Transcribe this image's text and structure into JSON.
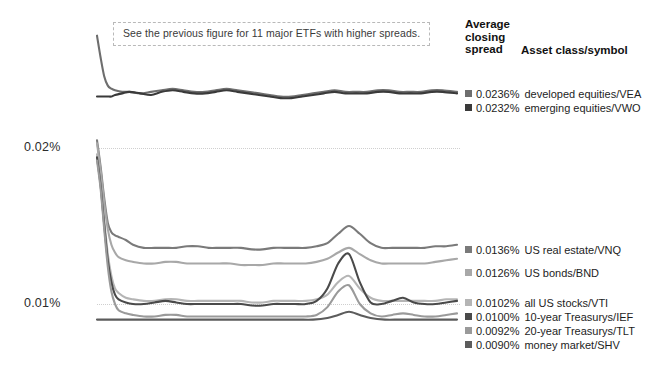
{
  "annotation": {
    "text": "See the previous figure for 11 major ETFs with higher spreads."
  },
  "legend": {
    "header_line1": "Average",
    "header_line2": "closing",
    "header_line3": "spread",
    "header_col2": "Asset class/symbol"
  },
  "chart_data": {
    "type": "line",
    "title": "",
    "xlabel": "",
    "ylabel": "",
    "grid": true,
    "legend_position": "right",
    "ylim": [
      0.0085,
      0.0275
    ],
    "ytick_labels": [
      "0.02%",
      "0.01%"
    ],
    "ytick_values": [
      0.02,
      0.01
    ],
    "xlim": [
      0,
      100
    ],
    "series": [
      {
        "name": "developed equities/VEA",
        "symbol": "VEA",
        "asset_class": "developed equities",
        "average_closing_spread": "0.0236%",
        "average_closing_spread_value": 0.0236,
        "color": "#6e6e6e",
        "x": [
          0,
          1,
          2,
          3,
          4,
          5,
          7,
          9,
          12,
          15,
          18,
          21,
          24,
          27,
          30,
          33,
          36,
          39,
          42,
          45,
          48,
          51,
          54,
          57,
          60,
          63,
          66,
          69,
          72,
          75,
          78,
          81,
          84,
          87,
          90,
          93,
          96,
          100
        ],
        "values": [
          0.0272,
          0.0258,
          0.0246,
          0.024,
          0.0238,
          0.0237,
          0.0236,
          0.0236,
          0.0235,
          0.0236,
          0.0237,
          0.0238,
          0.0237,
          0.0236,
          0.0236,
          0.0237,
          0.0238,
          0.0237,
          0.0236,
          0.0235,
          0.0234,
          0.0233,
          0.0233,
          0.0234,
          0.0235,
          0.0236,
          0.0237,
          0.0236,
          0.0236,
          0.0236,
          0.0237,
          0.0237,
          0.0236,
          0.0236,
          0.0236,
          0.0237,
          0.0237,
          0.0236
        ]
      },
      {
        "name": "emerging equities/VWO",
        "symbol": "VWO",
        "asset_class": "emerging equities",
        "average_closing_spread": "0.0232%",
        "average_closing_spread_value": 0.0232,
        "color": "#3a3a3a",
        "x": [
          0,
          1,
          2,
          3,
          4,
          5,
          7,
          9,
          12,
          15,
          18,
          21,
          24,
          27,
          30,
          33,
          36,
          39,
          42,
          45,
          48,
          51,
          54,
          57,
          60,
          63,
          66,
          69,
          72,
          75,
          78,
          81,
          84,
          87,
          90,
          93,
          96,
          100
        ],
        "values": [
          0.0233,
          0.0233,
          0.0233,
          0.0233,
          0.0233,
          0.0234,
          0.0235,
          0.0236,
          0.0235,
          0.0234,
          0.0236,
          0.0237,
          0.0236,
          0.0235,
          0.0235,
          0.0236,
          0.0237,
          0.0236,
          0.0235,
          0.0234,
          0.0233,
          0.0232,
          0.0232,
          0.0233,
          0.0234,
          0.0235,
          0.0236,
          0.0235,
          0.0235,
          0.0235,
          0.0236,
          0.0236,
          0.0235,
          0.0235,
          0.0235,
          0.0236,
          0.0236,
          0.0235
        ]
      },
      {
        "name": "US real estate/VNQ",
        "symbol": "VNQ",
        "asset_class": "US real estate",
        "average_closing_spread": "0.0136%",
        "average_closing_spread_value": 0.0136,
        "color": "#7a7a7a",
        "x": [
          0,
          1,
          2,
          3,
          4,
          5,
          6,
          8,
          10,
          13,
          16,
          19,
          22,
          25,
          28,
          31,
          34,
          37,
          40,
          43,
          46,
          49,
          52,
          55,
          58,
          61,
          64,
          67,
          70,
          73,
          76,
          79,
          82,
          85,
          88,
          91,
          94,
          97,
          100
        ],
        "values": [
          0.0205,
          0.0188,
          0.0168,
          0.0152,
          0.0146,
          0.0144,
          0.0143,
          0.0141,
          0.0138,
          0.0136,
          0.0136,
          0.0136,
          0.0136,
          0.0137,
          0.0137,
          0.0136,
          0.0136,
          0.0136,
          0.0136,
          0.0135,
          0.0135,
          0.0136,
          0.0136,
          0.0136,
          0.0136,
          0.0137,
          0.0139,
          0.0145,
          0.015,
          0.0145,
          0.0139,
          0.0136,
          0.0136,
          0.0136,
          0.0136,
          0.0136,
          0.0137,
          0.0137,
          0.0138
        ]
      },
      {
        "name": "US bonds/BND",
        "symbol": "BND",
        "asset_class": "US bonds",
        "average_closing_spread": "0.0126%",
        "average_closing_spread_value": 0.0126,
        "color": "#a8a8a8",
        "x": [
          0,
          1,
          2,
          3,
          4,
          5,
          6,
          8,
          10,
          13,
          16,
          19,
          22,
          25,
          28,
          31,
          34,
          37,
          40,
          43,
          46,
          49,
          52,
          55,
          58,
          61,
          64,
          67,
          70,
          73,
          76,
          79,
          82,
          85,
          88,
          91,
          94,
          97,
          100
        ],
        "values": [
          0.0203,
          0.0186,
          0.0165,
          0.0148,
          0.0138,
          0.0133,
          0.013,
          0.0128,
          0.0127,
          0.0126,
          0.0126,
          0.0127,
          0.0127,
          0.0126,
          0.0126,
          0.0126,
          0.0126,
          0.0126,
          0.0125,
          0.0125,
          0.0125,
          0.0126,
          0.0126,
          0.0126,
          0.0126,
          0.0127,
          0.0129,
          0.0133,
          0.0136,
          0.0132,
          0.0128,
          0.0126,
          0.0126,
          0.0126,
          0.0126,
          0.0126,
          0.0127,
          0.0128,
          0.0129
        ]
      },
      {
        "name": "all US stocks/VTI",
        "symbol": "VTI",
        "asset_class": "all US stocks",
        "average_closing_spread": "0.0102%",
        "average_closing_spread_value": 0.0102,
        "color": "#b5b5b5",
        "x": [
          0,
          1,
          2,
          3,
          4,
          5,
          6,
          8,
          10,
          13,
          16,
          19,
          22,
          25,
          28,
          31,
          34,
          37,
          40,
          43,
          46,
          49,
          52,
          55,
          58,
          61,
          64,
          67,
          70,
          73,
          76,
          79,
          82,
          85,
          88,
          91,
          94,
          97,
          100
        ],
        "values": [
          0.0196,
          0.0178,
          0.0154,
          0.0132,
          0.0118,
          0.011,
          0.0107,
          0.0104,
          0.0103,
          0.0102,
          0.0102,
          0.0103,
          0.0103,
          0.0102,
          0.0102,
          0.0102,
          0.0102,
          0.0102,
          0.0102,
          0.0101,
          0.0101,
          0.0102,
          0.0102,
          0.0102,
          0.0102,
          0.0103,
          0.0106,
          0.0114,
          0.0118,
          0.011,
          0.0104,
          0.0102,
          0.0102,
          0.0102,
          0.0102,
          0.0102,
          0.0102,
          0.0103,
          0.0103
        ]
      },
      {
        "name": "10-year Treasurys/IEF",
        "symbol": "IEF",
        "asset_class": "10-year Treasurys",
        "average_closing_spread": "0.0100%",
        "average_closing_spread_value": 0.01,
        "color": "#4a4a4a",
        "x": [
          0,
          1,
          2,
          3,
          4,
          5,
          6,
          8,
          10,
          13,
          16,
          19,
          22,
          25,
          28,
          31,
          34,
          37,
          40,
          43,
          46,
          49,
          52,
          55,
          58,
          61,
          64,
          67,
          70,
          73,
          76,
          79,
          82,
          85,
          88,
          91,
          94,
          97,
          100
        ],
        "values": [
          0.0194,
          0.0176,
          0.0151,
          0.0128,
          0.0114,
          0.0106,
          0.0103,
          0.0101,
          0.01,
          0.01,
          0.0101,
          0.0102,
          0.0101,
          0.01,
          0.01,
          0.01,
          0.01,
          0.01,
          0.01,
          0.0099,
          0.0099,
          0.01,
          0.01,
          0.01,
          0.01,
          0.0102,
          0.011,
          0.0126,
          0.0132,
          0.0114,
          0.0101,
          0.01,
          0.0102,
          0.0104,
          0.0101,
          0.01,
          0.01,
          0.0101,
          0.0102
        ]
      },
      {
        "name": "20-year Treasurys/TLT",
        "symbol": "TLT",
        "asset_class": "20-year Treasurys",
        "average_closing_spread": "0.0092%",
        "average_closing_spread_value": 0.0092,
        "color": "#9a9a9a",
        "x": [
          0,
          1,
          2,
          3,
          4,
          5,
          6,
          8,
          10,
          13,
          16,
          19,
          22,
          25,
          28,
          31,
          34,
          37,
          40,
          43,
          46,
          49,
          52,
          55,
          58,
          61,
          64,
          67,
          70,
          73,
          76,
          79,
          82,
          85,
          88,
          91,
          94,
          97,
          100
        ],
        "values": [
          0.0192,
          0.0174,
          0.0148,
          0.0124,
          0.0108,
          0.01,
          0.0096,
          0.0094,
          0.0093,
          0.0092,
          0.0092,
          0.0093,
          0.0093,
          0.0092,
          0.0092,
          0.0092,
          0.0092,
          0.0092,
          0.0092,
          0.0092,
          0.0092,
          0.0092,
          0.0092,
          0.0092,
          0.0092,
          0.0093,
          0.0098,
          0.0108,
          0.0112,
          0.01,
          0.0094,
          0.0092,
          0.0093,
          0.0094,
          0.0093,
          0.0092,
          0.0092,
          0.0093,
          0.0094
        ]
      },
      {
        "name": "money market/SHV",
        "symbol": "SHV",
        "asset_class": "money market",
        "average_closing_spread": "0.0090%",
        "average_closing_spread_value": 0.009,
        "color": "#5c5c5c",
        "x": [
          0,
          1,
          2,
          3,
          4,
          6,
          9,
          12,
          16,
          20,
          24,
          28,
          32,
          36,
          40,
          44,
          48,
          52,
          56,
          60,
          64,
          67,
          70,
          73,
          76,
          80,
          84,
          88,
          92,
          96,
          100
        ],
        "values": [
          0.009,
          0.009,
          0.009,
          0.009,
          0.009,
          0.009,
          0.009,
          0.009,
          0.009,
          0.009,
          0.009,
          0.009,
          0.009,
          0.009,
          0.009,
          0.009,
          0.009,
          0.009,
          0.009,
          0.009,
          0.0091,
          0.0093,
          0.0095,
          0.0093,
          0.0091,
          0.009,
          0.009,
          0.009,
          0.009,
          0.009,
          0.009
        ]
      }
    ]
  }
}
